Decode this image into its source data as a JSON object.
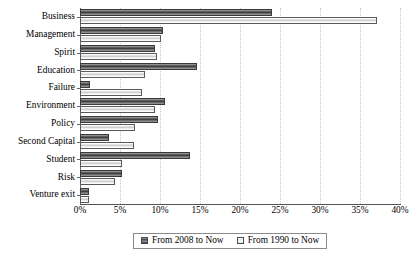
{
  "chart_data": {
    "type": "bar",
    "orientation": "horizontal",
    "title": "",
    "subtitle": "",
    "xlabel": "",
    "ylabel": "",
    "xlim": [
      0,
      40
    ],
    "xticks": [
      "0%",
      "5%",
      "10%",
      "15%",
      "20%",
      "25%",
      "30%",
      "35%",
      "40%"
    ],
    "xtick_values": [
      0,
      5,
      10,
      15,
      20,
      25,
      30,
      35,
      40
    ],
    "grid": true,
    "legend_position": "bottom-center",
    "categories": [
      "Business",
      "Management",
      "Spirit",
      "Education",
      "Failure",
      "Environment",
      "Policy",
      "Second Capital",
      "Student",
      "Risk",
      "Venture exit"
    ],
    "series": [
      {
        "name": "From 2008 to Now",
        "color": "#5e5e5e",
        "values": [
          24.0,
          10.4,
          9.4,
          14.6,
          1.3,
          10.6,
          9.8,
          3.6,
          13.7,
          5.2,
          1.1
        ]
      },
      {
        "name": "From 1990 to Now",
        "color": "#e2e2e2",
        "values": [
          37.1,
          10.1,
          9.6,
          8.1,
          7.7,
          9.4,
          6.9,
          6.7,
          5.2,
          4.4,
          1.1
        ]
      }
    ]
  },
  "legend": {
    "entries": [
      {
        "label": "From 2008 to Now",
        "swatch": "dark-striped-swatch"
      },
      {
        "label": "From 1990 to Now",
        "swatch": "light-striped-swatch"
      }
    ]
  }
}
